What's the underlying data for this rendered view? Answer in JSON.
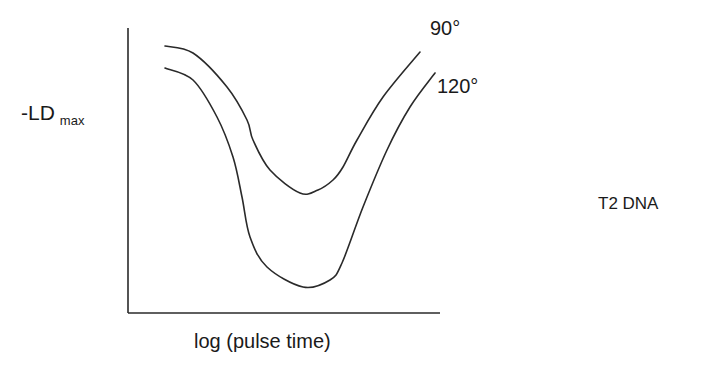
{
  "chart_data": {
    "type": "line",
    "title": "",
    "xlabel": "log (pulse time)",
    "ylabel": "-LD",
    "ylabel_subscript": "max",
    "annotation": "T2 DNA",
    "grid": false,
    "ticks": false,
    "legend_position": "inline labels at right end of curves",
    "note": "Schematic curves with no numeric axes; points are traced screen coordinates (px) of each curve.",
    "axes": {
      "origin": [
        128,
        313
      ],
      "y_top": [
        128,
        28
      ],
      "x_right": [
        440,
        313
      ]
    },
    "series": [
      {
        "name": "90°",
        "label_position": [
          430,
          16
        ],
        "points": [
          [
            165,
            46
          ],
          [
            193,
            53
          ],
          [
            227,
            87
          ],
          [
            247,
            120
          ],
          [
            253,
            140
          ],
          [
            270,
            170
          ],
          [
            300,
            193
          ],
          [
            318,
            190
          ],
          [
            333,
            180
          ],
          [
            343,
            167
          ],
          [
            357,
            140
          ],
          [
            383,
            97
          ],
          [
            420,
            52
          ]
        ]
      },
      {
        "name": "120°",
        "label_position": [
          437,
          74
        ],
        "points": [
          [
            165,
            68
          ],
          [
            193,
            80
          ],
          [
            217,
            117
          ],
          [
            233,
            157
          ],
          [
            242,
            197
          ],
          [
            250,
            237
          ],
          [
            267,
            267
          ],
          [
            303,
            287
          ],
          [
            330,
            280
          ],
          [
            342,
            263
          ],
          [
            363,
            207
          ],
          [
            387,
            150
          ],
          [
            410,
            107
          ],
          [
            435,
            73
          ]
        ]
      }
    ]
  },
  "labels": {
    "xlabel": "log (pulse time)",
    "ylabel_main": "-LD",
    "ylabel_sub": "max",
    "series_0": "90°",
    "series_1": "120°",
    "annotation": "T2 DNA"
  },
  "colors": {
    "line": "#2a2a2a",
    "text": "#1a1a1a",
    "background": "#ffffff"
  }
}
